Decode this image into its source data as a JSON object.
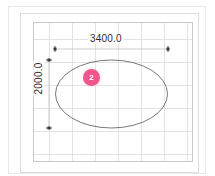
{
  "drawing": {
    "dimensions": {
      "width_label": "3400.0",
      "height_label": "2000.0"
    },
    "shape": {
      "type": "ellipse",
      "marker_label": "2",
      "marker_color": "#f0558c",
      "outline_color": "#555558"
    },
    "grid": {
      "line_color": "#e3e3e7",
      "spacing_px": 23
    },
    "frame": {
      "outer_border_color": "#e9e9ec",
      "mid_border_color": "#dcdcdf",
      "panel_border_color": "#c9c9cd"
    }
  }
}
